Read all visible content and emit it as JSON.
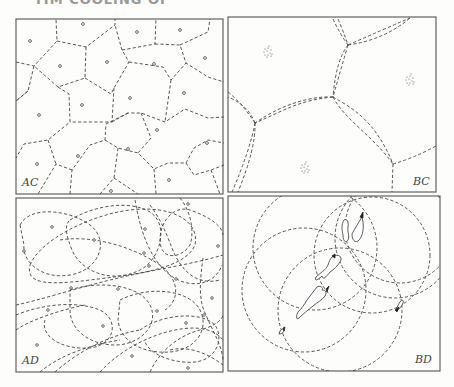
{
  "heading_fragment": "TIM COOLING OF",
  "panels": [
    {
      "id": "AC",
      "label": "AC",
      "frame": [
        16,
        19,
        207,
        175
      ],
      "label_pos": [
        22,
        186
      ],
      "sites": [
        [
          83,
          24
        ],
        [
          30,
          41
        ],
        [
          60,
          66
        ],
        [
          107,
          62
        ],
        [
          137,
          32
        ],
        [
          180,
          30
        ],
        [
          154,
          64
        ],
        [
          205,
          58
        ],
        [
          82,
          105
        ],
        [
          39,
          115
        ],
        [
          130,
          98
        ],
        [
          184,
          93
        ],
        [
          157,
          130
        ],
        [
          207,
          143
        ],
        [
          78,
          156
        ],
        [
          37,
          164
        ],
        [
          128,
          149
        ],
        [
          169,
          180
        ],
        [
          111,
          191
        ]
      ],
      "edges": [
        [
          [
            16,
            62
          ],
          [
            34,
            66
          ],
          [
            57,
            41
          ],
          [
            56,
            19
          ]
        ],
        [
          [
            57,
            41
          ],
          [
            86,
            47
          ],
          [
            115,
            25
          ],
          [
            115,
            19
          ]
        ],
        [
          [
            86,
            47
          ],
          [
            85,
            78
          ],
          [
            58,
            87
          ],
          [
            34,
            66
          ]
        ],
        [
          [
            34,
            66
          ],
          [
            28,
            91
          ],
          [
            16,
            101
          ]
        ],
        [
          [
            58,
            87
          ],
          [
            69,
            94
          ],
          [
            70,
            122
          ],
          [
            48,
            140
          ],
          [
            24,
            144
          ],
          [
            16,
            158
          ]
        ],
        [
          [
            85,
            78
          ],
          [
            111,
            94
          ],
          [
            114,
            88
          ],
          [
            129,
            62
          ],
          [
            122,
            50
          ],
          [
            115,
            25
          ]
        ],
        [
          [
            122,
            50
          ],
          [
            155,
            44
          ],
          [
            156,
            19
          ]
        ],
        [
          [
            155,
            44
          ],
          [
            180,
            45
          ],
          [
            186,
            63
          ],
          [
            208,
            77
          ],
          [
            224,
            82
          ]
        ],
        [
          [
            180,
            45
          ],
          [
            208,
            32
          ],
          [
            210,
            19
          ]
        ],
        [
          [
            129,
            62
          ],
          [
            163,
            67
          ],
          [
            171,
            80
          ],
          [
            186,
            63
          ]
        ],
        [
          [
            114,
            88
          ],
          [
            112,
            122
          ],
          [
            70,
            122
          ]
        ],
        [
          [
            112,
            122
          ],
          [
            128,
            113
          ],
          [
            141,
            113
          ],
          [
            165,
            122
          ],
          [
            185,
            109
          ],
          [
            208,
            118
          ],
          [
            224,
            117
          ]
        ],
        [
          [
            171,
            80
          ],
          [
            165,
            122
          ]
        ],
        [
          [
            141,
            113
          ],
          [
            151,
            138
          ],
          [
            138,
            153
          ],
          [
            154,
            169
          ],
          [
            168,
            163
          ],
          [
            186,
            163
          ],
          [
            194,
            148
          ],
          [
            208,
            140
          ],
          [
            224,
            143
          ]
        ],
        [
          [
            128,
            113
          ],
          [
            106,
            124
          ],
          [
            105,
            140
          ],
          [
            90,
            145
          ],
          [
            72,
            170
          ],
          [
            70,
            194
          ]
        ],
        [
          [
            105,
            140
          ],
          [
            118,
            148
          ],
          [
            138,
            153
          ]
        ],
        [
          [
            72,
            170
          ],
          [
            56,
            164
          ],
          [
            38,
            194
          ]
        ],
        [
          [
            48,
            140
          ],
          [
            56,
            164
          ]
        ],
        [
          [
            154,
            169
          ],
          [
            156,
            194
          ]
        ],
        [
          [
            186,
            163
          ],
          [
            194,
            175
          ],
          [
            211,
            170
          ],
          [
            224,
            165
          ]
        ],
        [
          [
            118,
            148
          ],
          [
            114,
            178
          ],
          [
            100,
            194
          ]
        ],
        [
          [
            114,
            178
          ],
          [
            138,
            194
          ]
        ],
        [
          [
            211,
            170
          ],
          [
            220,
            194
          ]
        ],
        [
          [
            28,
            91
          ],
          [
            16,
            101
          ]
        ]
      ]
    },
    {
      "id": "BC",
      "label": "BC",
      "frame": [
        228,
        17,
        208,
        175
      ],
      "label_pos": [
        413,
        185
      ],
      "clusters": [
        [
          268,
          52
        ],
        [
          410,
          80
        ],
        [
          305,
          168
        ]
      ],
      "edges": [
        [
          [
            333,
            19
          ],
          [
            340,
            34
          ],
          [
            348,
            45
          ]
        ],
        [
          [
            338,
            19
          ],
          [
            344,
            33
          ],
          [
            348,
            45
          ]
        ],
        [
          [
            348,
            45
          ],
          [
            382,
            30
          ],
          [
            410,
            18
          ]
        ],
        [
          [
            348,
            45
          ],
          [
            384,
            40
          ],
          [
            410,
            18
          ]
        ],
        [
          [
            348,
            45
          ],
          [
            340,
            72
          ],
          [
            333,
            97
          ]
        ],
        [
          [
            348,
            45
          ],
          [
            336,
            60
          ],
          [
            333,
            97
          ]
        ],
        [
          [
            333,
            97
          ],
          [
            300,
            100
          ],
          [
            285,
            110
          ],
          [
            255,
            123
          ]
        ],
        [
          [
            333,
            97
          ],
          [
            315,
            96
          ],
          [
            285,
            102
          ],
          [
            255,
            123
          ]
        ],
        [
          [
            255,
            123
          ],
          [
            241,
            102
          ],
          [
            228,
            92
          ]
        ],
        [
          [
            255,
            123
          ],
          [
            248,
            105
          ],
          [
            228,
            97
          ]
        ],
        [
          [
            255,
            123
          ],
          [
            250,
            150
          ],
          [
            232,
            192
          ]
        ],
        [
          [
            255,
            123
          ],
          [
            256,
            148
          ],
          [
            238,
            192
          ]
        ],
        [
          [
            333,
            97
          ],
          [
            345,
            120
          ],
          [
            372,
            135
          ],
          [
            393,
            164
          ]
        ],
        [
          [
            333,
            97
          ],
          [
            352,
            108
          ],
          [
            375,
            120
          ],
          [
            393,
            164
          ]
        ],
        [
          [
            393,
            164
          ],
          [
            414,
            158
          ],
          [
            436,
            146
          ]
        ],
        [
          [
            393,
            164
          ],
          [
            392,
            192
          ]
        ]
      ]
    },
    {
      "id": "AD",
      "label": "AD",
      "frame": [
        16,
        198,
        207,
        174
      ],
      "label_pos": [
        22,
        364
      ],
      "sites": [
        [
          52,
          227
        ],
        [
          94,
          240
        ],
        [
          24,
          251
        ],
        [
          145,
          229
        ],
        [
          144,
          253
        ],
        [
          149,
          266
        ],
        [
          176,
          279
        ],
        [
          71,
          288
        ],
        [
          118,
          289
        ],
        [
          48,
          310
        ],
        [
          157,
          311
        ],
        [
          212,
          298
        ],
        [
          204,
          315
        ],
        [
          103,
          326
        ],
        [
          186,
          323
        ],
        [
          37,
          345
        ],
        [
          132,
          356
        ],
        [
          188,
          368
        ],
        [
          188,
          204
        ],
        [
          218,
          246
        ]
      ]
    },
    {
      "id": "BD",
      "label": "BD",
      "frame": [
        228,
        196,
        212,
        175
      ],
      "label_pos": [
        415,
        363
      ],
      "circles": [
        {
          "cx": 315,
          "cy": 248,
          "r": 62
        },
        {
          "cx": 372,
          "cy": 255,
          "r": 58
        },
        {
          "cx": 304,
          "cy": 290,
          "r": 62
        },
        {
          "cx": 340,
          "cy": 310,
          "r": 62
        },
        {
          "cx": 400,
          "cy": 228,
          "r": 55
        },
        {
          "cx": 395,
          "cy": 238,
          "r": 60
        }
      ]
    }
  ]
}
